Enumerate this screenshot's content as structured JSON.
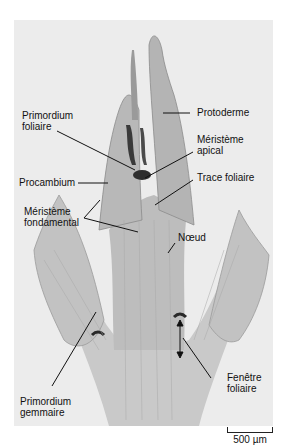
{
  "figure": {
    "labels": {
      "primordium_foliaire": [
        "Primordium",
        "foliaire"
      ],
      "protoderme": "Protoderme",
      "meristeme_apical": [
        "Méristème",
        "apical"
      ],
      "procambium": "Procambium",
      "trace_foliaire": "Trace foliaire",
      "meristeme_fondamental": [
        "Méristème",
        "fondamental"
      ],
      "noeud": "Nœud",
      "fenetre_foliaire": [
        "Fenêtre",
        "foliaire"
      ],
      "primordium_gemmaire": [
        "Primordium",
        "gemmaire"
      ]
    },
    "scale_bar": "500 µm",
    "colors": {
      "background": "#ececec",
      "tissue": "#c4c4c4",
      "tissue_dark": "#8a8a8a",
      "stain": "#2e2e2e",
      "text": "#111111"
    }
  }
}
